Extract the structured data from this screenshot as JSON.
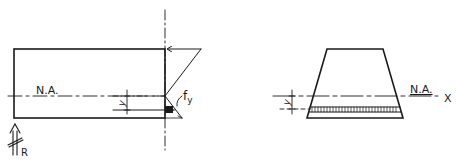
{
  "left_figure": {
    "neutral_axis_label": "N.A.",
    "y_label": "y",
    "stress_label": "f",
    "stress_subscript": "y",
    "reaction_label": "R"
  },
  "right_figure": {
    "neutral_axis_label": "N.A.",
    "axis_label": "X",
    "y_label": "y"
  },
  "colors": {
    "ink": "#1a1a1a",
    "background": "#ffffff"
  }
}
